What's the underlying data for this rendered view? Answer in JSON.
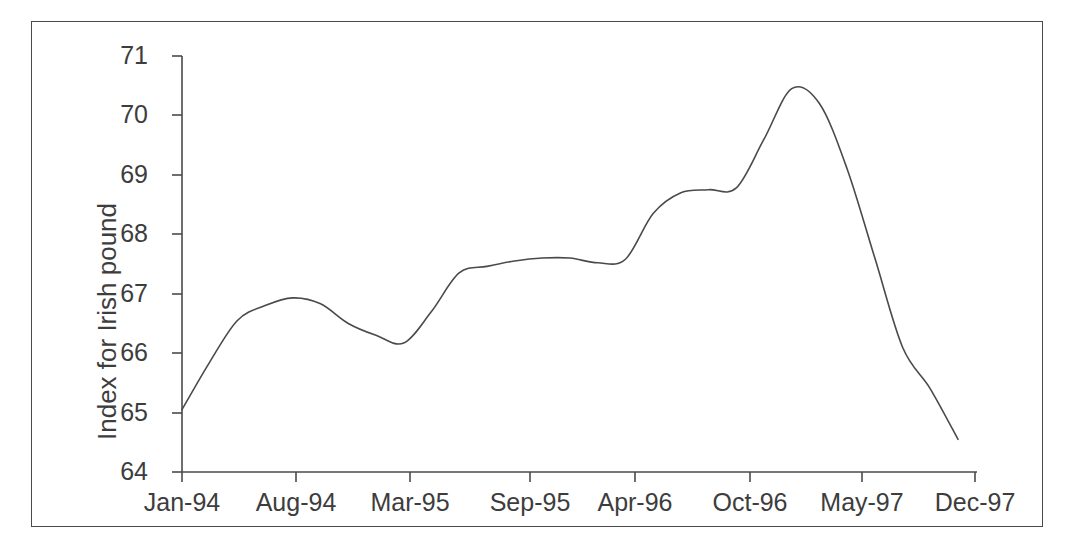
{
  "chart_data": {
    "type": "line",
    "title": "",
    "subtitle": "",
    "xlabel": "",
    "ylabel": "Index for Irish pound",
    "ylim": [
      64,
      71
    ],
    "yticks": [
      64,
      65,
      66,
      67,
      68,
      69,
      70,
      71
    ],
    "ytick_labels": [
      "64",
      "65",
      "66",
      "67",
      "68",
      "69",
      "70",
      "71"
    ],
    "xtick_labels": [
      "Jan-94",
      "Aug-94",
      "Mar-95",
      "Sep-95",
      "Apr-96",
      "Oct-96",
      "May-97",
      "Dec-97"
    ],
    "categories": [
      "Jan-94",
      "Aug-94",
      "Mar-95",
      "Sep-95",
      "Apr-96",
      "Oct-96",
      "May-97",
      "Dec-97"
    ],
    "grid": false,
    "legend": false,
    "legend_position": "none",
    "line_color": "#4a4a4a",
    "line_width": 1.6,
    "series": [
      {
        "name": "Index for Irish pound",
        "x": [
          "Jan-94",
          "Mar-94",
          "May-94",
          "Jun-94",
          "Aug-94",
          "Oct-94",
          "Dec-94",
          "Jan-95",
          "Mar-95",
          "Apr-95",
          "Jun-95",
          "Jul-95",
          "Sep-95",
          "Nov-95",
          "Dec-95",
          "Feb-96",
          "Apr-96",
          "Jun-96",
          "Jul-96",
          "Aug-96",
          "Oct-96",
          "Nov-96",
          "Jan-97",
          "Mar-97",
          "May-97",
          "Jul-97",
          "Sep-97",
          "Oct-97",
          "Dec-97"
        ],
        "values": [
          65.05,
          65.85,
          66.55,
          66.8,
          66.93,
          66.83,
          66.5,
          66.3,
          66.17,
          66.7,
          67.35,
          67.46,
          67.55,
          67.6,
          67.6,
          67.52,
          67.58,
          68.35,
          68.7,
          68.75,
          68.78,
          69.6,
          70.45,
          70.2,
          69.1,
          67.6,
          66.1,
          65.4,
          64.55
        ]
      }
    ],
    "annotations": []
  },
  "axes": {
    "y_axis_title": "Index for Irish pound",
    "y_tick_labels": [
      "71",
      "70",
      "69",
      "68",
      "67",
      "66",
      "65",
      "64"
    ],
    "x_tick_labels": [
      "Jan-94",
      "Aug-94",
      "Mar-95",
      "Sep-95",
      "Apr-96",
      "Oct-96",
      "May-97",
      "Dec-97"
    ]
  }
}
